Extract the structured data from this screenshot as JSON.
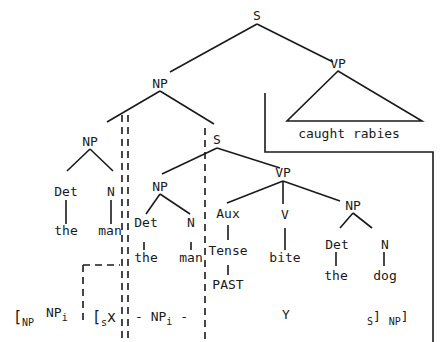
{
  "diagram": {
    "type": "syntax-tree",
    "root": {
      "label": "S"
    },
    "nodes": {
      "s_root": "S",
      "np_top": "NP",
      "vp_top": "VP",
      "vp_top_text": "caught rabies",
      "np_left": "NP",
      "np_left_det": "Det",
      "np_left_n": "N",
      "np_left_the": "the",
      "np_left_man": "man",
      "s_rel": "S",
      "np_rel": "NP",
      "np_rel_det": "Det",
      "np_rel_n": "N",
      "np_rel_the": "the",
      "np_rel_man": "man",
      "aux": "Aux",
      "tense": "Tense",
      "past": "PAST",
      "vp_rel": "VP",
      "v": "V",
      "bite": "bite",
      "np_obj": "NP",
      "np_obj_det": "Det",
      "np_obj_n": "N",
      "np_obj_the": "the",
      "np_obj_dog": "dog"
    },
    "bracketing": {
      "open_np": "[",
      "np_sub": "NP",
      "np_i": "NP",
      "i_sub": "i",
      "open_s": "[",
      "s_sub": "s",
      "x": "x",
      "dash1": "-",
      "np_i2": "NP",
      "i_sub2": "i",
      "dash2": "-",
      "y": "Y",
      "s_close_pre": "S",
      "close1": "]",
      "np_close_pre": "NP",
      "close2": "]"
    }
  }
}
